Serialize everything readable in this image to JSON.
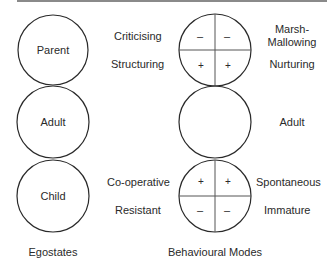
{
  "egostates": {
    "circles": [
      {
        "label": "Parent"
      },
      {
        "label": "Adult"
      },
      {
        "label": "Child"
      }
    ],
    "caption": "Egostates"
  },
  "behavioural_modes": {
    "parent_modes": {
      "left_labels": [
        "Criticising",
        "Structuring"
      ],
      "right_labels": [
        "Marsh-",
        "Mallowing",
        "Nurturing"
      ],
      "top_signs": [
        "–",
        "–"
      ],
      "bottom_signs": [
        "+",
        "+"
      ]
    },
    "adult_mode": {
      "label": "Adult"
    },
    "child_modes": {
      "left_labels": [
        "Co-operative",
        "Resistant"
      ],
      "right_labels": [
        "Spontaneous",
        "Immature"
      ],
      "top_signs": [
        "+",
        "+"
      ],
      "bottom_signs": [
        "–",
        "–"
      ]
    },
    "caption": "Behavioural Modes"
  },
  "colors": {
    "stroke": "#2a2a2a",
    "divider": "#555555",
    "rule": "#8a8a8a"
  }
}
